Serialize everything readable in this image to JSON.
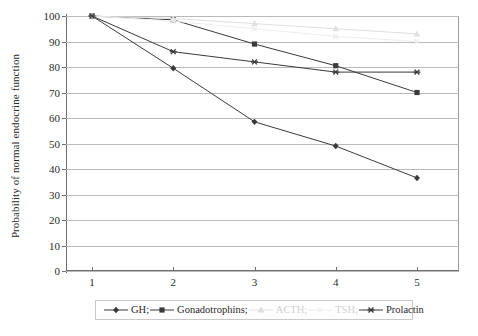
{
  "chart_data": {
    "type": "line",
    "title": "",
    "xlabel": "",
    "ylabel": "Probability of normal endocrine function",
    "categories": [
      "1",
      "2",
      "3",
      "4",
      "5"
    ],
    "x": [
      1,
      2,
      3,
      4,
      5
    ],
    "ylim": [
      0,
      100
    ],
    "yticks": [
      0,
      10,
      20,
      30,
      40,
      50,
      60,
      70,
      80,
      90,
      100
    ],
    "grid": true,
    "legend_position": "bottom",
    "series": [
      {
        "name": "GH",
        "legend_label": "GH;",
        "marker": "diamond",
        "color": "#3a3a3a",
        "values": [
          100,
          79.5,
          58.5,
          49,
          36.5
        ]
      },
      {
        "name": "Gonadotrophins",
        "legend_label": "Gonadotrophins;",
        "marker": "square",
        "color": "#3a3a3a",
        "values": [
          100,
          98.5,
          89,
          80.5,
          70
        ]
      },
      {
        "name": "ACTH",
        "legend_label": "ACTH;",
        "marker": "triangle",
        "color": "#e0e0e0",
        "values": [
          100,
          99,
          97,
          95,
          93
        ]
      },
      {
        "name": "TSH",
        "legend_label": "TSH;",
        "marker": "cross",
        "color": "#ededed",
        "values": [
          100,
          98,
          95,
          92,
          90
        ]
      },
      {
        "name": "Prolactin",
        "legend_label": "Prolactin",
        "marker": "asterisk",
        "color": "#3a3a3a",
        "values": [
          100,
          86,
          82,
          78,
          78
        ]
      }
    ]
  },
  "colors": {
    "axis": "#6f6f6f",
    "grid": "#b9b9b9",
    "text": "#2b2b2b",
    "faint": "#dcdcdc"
  }
}
